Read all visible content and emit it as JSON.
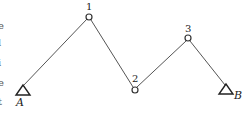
{
  "diagram": {
    "type": "truss-polyline",
    "colors": {
      "stroke": "#555555",
      "text": "#222222"
    },
    "supports": [
      {
        "id": "A",
        "label": "A",
        "x": 23,
        "y": 90
      },
      {
        "id": "B",
        "label": "B",
        "x": 226,
        "y": 89
      }
    ],
    "nodes": [
      {
        "id": "1",
        "label": "1",
        "x": 89,
        "y": 17
      },
      {
        "id": "2",
        "label": "2",
        "x": 135,
        "y": 90
      },
      {
        "id": "3",
        "label": "3",
        "x": 188,
        "y": 38
      }
    ],
    "members": [
      {
        "from": "A",
        "to": "1"
      },
      {
        "from": "1",
        "to": "2"
      },
      {
        "from": "2",
        "to": "3"
      },
      {
        "from": "3",
        "to": "B"
      }
    ],
    "left_text_fragments": [
      "e",
      "l",
      "i",
      "e",
      "t"
    ]
  }
}
